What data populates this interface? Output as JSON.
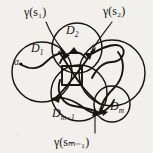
{
  "figure": {
    "kind": "mathematical-diagram",
    "caption": "",
    "background_color": "#f2f0ec",
    "ink_color": "#17150f",
    "disks": [
      {
        "id": "D1",
        "label": "D",
        "sub": "1",
        "cx": 42,
        "cy": 72,
        "r": 30
      },
      {
        "id": "D2",
        "label": "D",
        "sub": "2",
        "cx": 77,
        "cy": 48,
        "r": 25
      },
      {
        "id": "Dm1",
        "label": "D",
        "sub": "m−1",
        "cx": 79,
        "cy": 93,
        "r": 28
      },
      {
        "id": "Dm",
        "label": "D",
        "sub": "m",
        "cx": 112,
        "cy": 104,
        "r": 18
      },
      {
        "id": "Dbig",
        "label": "",
        "sub": "",
        "cx": 112,
        "cy": 73,
        "r": 33
      }
    ],
    "points": [
      {
        "id": "a",
        "label": "a",
        "x": 19,
        "y": 63
      },
      {
        "id": "b",
        "label": "b",
        "x": 101,
        "y": 113
      }
    ],
    "annotations": [
      {
        "id": "gamma-s1",
        "text": "γ(s₁)",
        "x": 24,
        "y": 9,
        "arrow_to_x": 66,
        "arrow_to_y": 52
      },
      {
        "id": "gamma-s2",
        "text": "γ(s₂)",
        "x": 104,
        "y": 7,
        "arrow_to_x": 91,
        "arrow_to_y": 50
      },
      {
        "id": "gamma-sm1",
        "text": "γ(sₘ₋₁)",
        "x": 54,
        "y": 139,
        "arrow_to_x": 95,
        "arrow_to_y": 110
      }
    ],
    "curve": {
      "name": "gamma",
      "from_point": "a",
      "to_point": "b",
      "arrowheads": 4
    }
  }
}
